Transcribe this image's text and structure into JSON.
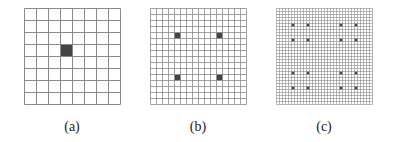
{
  "figure": {
    "panels": [
      {
        "id": "a",
        "caption": "(a)",
        "x": 24,
        "y": 8,
        "size": 96,
        "cells": 8,
        "filled": [
          [
            3,
            3
          ]
        ]
      },
      {
        "id": "b",
        "caption": "(b)",
        "x": 150,
        "y": 8,
        "size": 96,
        "cells": 16,
        "filled": [
          [
            4,
            4
          ],
          [
            11,
            4
          ],
          [
            4,
            11
          ],
          [
            11,
            11
          ]
        ]
      },
      {
        "id": "c",
        "caption": "(c)",
        "x": 276,
        "y": 8,
        "size": 96,
        "cells": 32,
        "filled": [
          [
            5,
            5
          ],
          [
            10,
            5
          ],
          [
            21,
            5
          ],
          [
            26,
            5
          ],
          [
            5,
            10
          ],
          [
            10,
            10
          ],
          [
            21,
            10
          ],
          [
            26,
            10
          ],
          [
            5,
            21
          ],
          [
            10,
            21
          ],
          [
            21,
            21
          ],
          [
            26,
            21
          ],
          [
            5,
            26
          ],
          [
            10,
            26
          ],
          [
            21,
            26
          ],
          [
            26,
            26
          ]
        ]
      }
    ],
    "colors": {
      "grid_line": "#8a8a8a",
      "filled_cell": "#444444",
      "background": "#ffffff"
    }
  }
}
